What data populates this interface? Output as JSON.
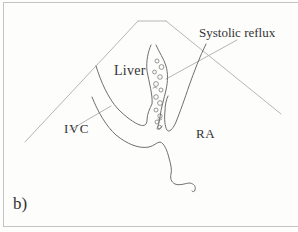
{
  "figure": {
    "panel_label": "b)",
    "labels": {
      "liver": "Liver",
      "ivc": "IVC",
      "ra": "RA",
      "systolic_reflux": "Systolic reflux"
    },
    "colors": {
      "background": "#fdfdfc",
      "frame_border": "#c4c4c4",
      "sector_line": "#b6b6b6",
      "anatomy_line": "#6f6f6f",
      "text": "#333333"
    }
  }
}
